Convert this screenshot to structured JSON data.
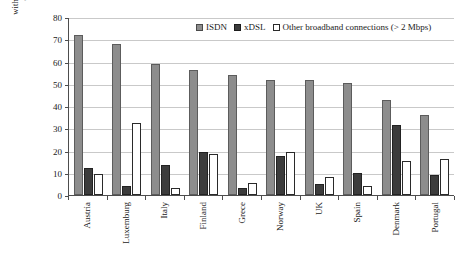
{
  "chart_data": {
    "type": "bar",
    "title": "",
    "xlabel": "",
    "ylabel": "% of connected firms with more than 10 employees",
    "ylabel_lines": [
      "% of connected firms",
      "with more than 10 employees"
    ],
    "ylim": [
      0,
      80
    ],
    "y_ticks": [
      0,
      10,
      20,
      30,
      40,
      50,
      60,
      70,
      80
    ],
    "grid": true,
    "legend_position": "top-right",
    "categories": [
      "Austria",
      "Luxemburg",
      "Italy",
      "Finland",
      "Grece",
      "Norway",
      "UK",
      "Spain",
      "Denmark",
      "Portugal"
    ],
    "series": [
      {
        "name": "ISDN",
        "color": "#8d8d8d",
        "values": [
          72,
          68,
          59,
          56,
          54,
          51.5,
          51.5,
          50.5,
          42.5,
          36
        ]
      },
      {
        "name": "xDSL",
        "color": "#3c3c3c",
        "values": [
          12,
          4,
          13.5,
          19.5,
          3,
          17.5,
          5,
          10,
          31.5,
          9
        ]
      },
      {
        "name": "Other broadband connections (> 2 Mbps)",
        "color": "#ffffff",
        "values": [
          9.5,
          32.5,
          3,
          18.5,
          5.5,
          19.5,
          8,
          4,
          15.5,
          16
        ]
      }
    ]
  },
  "legend": {
    "items": [
      {
        "label": "ISDN",
        "swatch": "isdn"
      },
      {
        "label": "xDSL",
        "swatch": "xdsl"
      },
      {
        "label": "Other broadband connections (> 2 Mbps)",
        "swatch": "other"
      }
    ]
  }
}
